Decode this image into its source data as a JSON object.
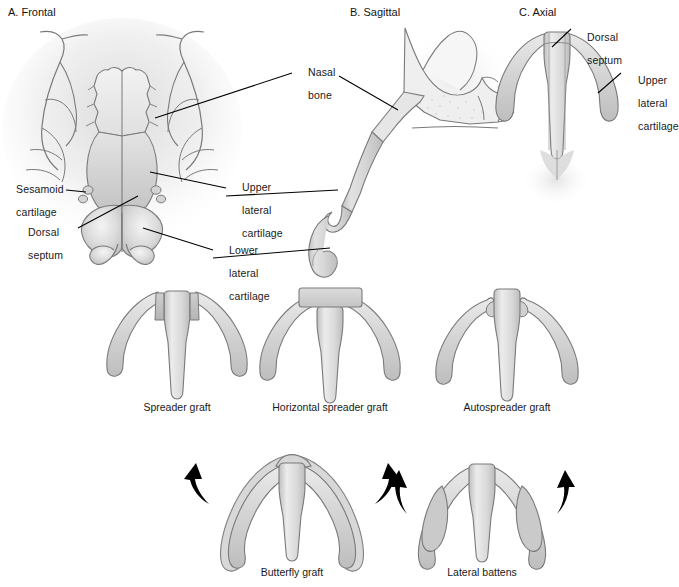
{
  "figure": {
    "background": "#ffffff",
    "colors": {
      "outline": "#6e6e6e",
      "cartilage_fill": "#d2d2d2",
      "cartilage_light": "#e8e8e8",
      "graft_block": "#c0c0c0",
      "bone_tint": "#ededed",
      "arrow": "#000000",
      "text": "#191919",
      "leader_line": "#000000"
    }
  },
  "panels": [
    {
      "id": "a",
      "title": "A. Frontal"
    },
    {
      "id": "b",
      "title": "B. Sagittal"
    },
    {
      "id": "c",
      "title": "C. Axial"
    }
  ],
  "labels": {
    "nasal_bone": {
      "line1": "Nasal",
      "line2": "bone"
    },
    "sesamoid_cartilage": {
      "line1": "Sesamoid",
      "line2": "cartilage"
    },
    "dorsal_septum_a": {
      "line1": "Dorsal",
      "line2": "septum"
    },
    "upper_lateral_cartilage_a": {
      "line1": "Upper",
      "line2": "lateral",
      "line3": "cartilage"
    },
    "lower_lateral_cartilage_a": {
      "line1": "Lower",
      "line2": "lateral",
      "line3": "cartilage"
    },
    "dorsal_septum_c": {
      "line1": "Dorsal",
      "line2": "septum"
    },
    "upper_lateral_cartilage_c": {
      "line1": "Upper",
      "line2": "lateral",
      "line3": "cartilage"
    }
  },
  "grafts": {
    "row1": [
      {
        "id": "spreader",
        "caption": "Spreader graft"
      },
      {
        "id": "horizontal-spreader",
        "caption": "Horizontal spreader graft"
      },
      {
        "id": "autospreader",
        "caption": "Autospreader graft"
      }
    ],
    "row2": [
      {
        "id": "butterfly",
        "caption": "Butterfly graft",
        "arrows": 2
      },
      {
        "id": "lateral-battens",
        "caption": "Lateral battens",
        "arrows": 2
      }
    ]
  }
}
